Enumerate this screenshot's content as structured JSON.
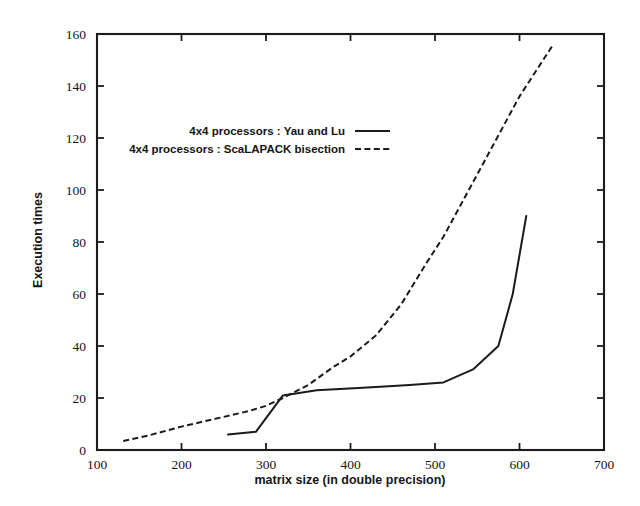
{
  "chart_data": {
    "type": "line",
    "title": "",
    "subtitle": "",
    "xlabel": "matrix size (in double precision)",
    "ylabel": "Execution times",
    "xlim": [
      100,
      700
    ],
    "ylim": [
      0,
      160
    ],
    "xticks": [
      100,
      200,
      300,
      400,
      500,
      600,
      700
    ],
    "yticks": [
      0,
      20,
      40,
      60,
      80,
      100,
      120,
      140,
      160
    ],
    "xtick_labels": [
      "100",
      "200",
      "300",
      "400",
      "500",
      "600",
      "700"
    ],
    "ytick_labels": [
      "0",
      "20",
      "40",
      "60",
      "80",
      "100",
      "120",
      "140",
      "160"
    ],
    "grid": false,
    "legend_position": "upper-left-inset",
    "series": [
      {
        "name": "4x4 processors : Yau and Lu",
        "style": "solid",
        "color": "#1b1b1b",
        "points": [
          [
            255,
            6
          ],
          [
            288,
            7
          ],
          [
            320,
            21
          ],
          [
            360,
            23
          ],
          [
            420,
            24
          ],
          [
            470,
            25
          ],
          [
            510,
            26
          ],
          [
            545,
            31
          ],
          [
            575,
            40
          ],
          [
            592,
            60
          ],
          [
            608,
            90
          ]
        ]
      },
      {
        "name": "4x4 processors : ScaLAPACK bisection",
        "style": "dashed",
        "color": "#1b1b1b",
        "points": [
          [
            131,
            3.5
          ],
          [
            160,
            5.5
          ],
          [
            200,
            9
          ],
          [
            240,
            12
          ],
          [
            280,
            15
          ],
          [
            300,
            17
          ],
          [
            320,
            20
          ],
          [
            350,
            25
          ],
          [
            380,
            32
          ],
          [
            400,
            36
          ],
          [
            430,
            44
          ],
          [
            460,
            56
          ],
          [
            490,
            72
          ],
          [
            510,
            82
          ],
          [
            540,
            100
          ],
          [
            570,
            118
          ],
          [
            600,
            136
          ],
          [
            640,
            156
          ]
        ]
      }
    ]
  },
  "legend": {
    "entries": [
      {
        "label": "4x4 processors : Yau and Lu",
        "style": "solid"
      },
      {
        "label": "4x4 processors : ScaLAPACK bisection",
        "style": "dashed"
      }
    ]
  },
  "axes": {
    "x_title": "matrix size (in double precision)",
    "y_title": "Execution times"
  },
  "colors": {
    "background": "#ffffff",
    "foreground": "#1b1b1b",
    "axis": "#1c1c1c"
  }
}
